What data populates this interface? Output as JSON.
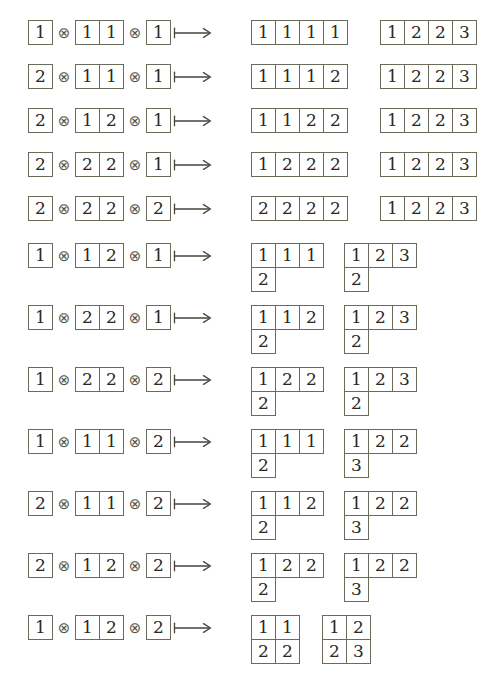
{
  "figure": {
    "type": "tableaux-correspondence-list",
    "operator_tensor": "⊗",
    "operator_maps_to": "⟼",
    "border_color": "#6b6b5c",
    "text_color": "#28281f",
    "background": "#ffffff",
    "cell_size_px": 25
  },
  "rows": [
    {
      "id": "row-1",
      "top": 20,
      "lhs": [
        [
          "1"
        ],
        [
          "1",
          "1"
        ],
        [
          "1"
        ]
      ],
      "rhs": [
        {
          "shape": "1x4",
          "rows": [
            [
              "1",
              "1",
              "1",
              "1"
            ]
          ]
        },
        {
          "shape": "1x4",
          "rows": [
            [
              "1",
              "2",
              "2",
              "3"
            ]
          ]
        }
      ]
    },
    {
      "id": "row-2",
      "top": 64,
      "lhs": [
        [
          "2"
        ],
        [
          "1",
          "1"
        ],
        [
          "1"
        ]
      ],
      "rhs": [
        {
          "shape": "1x4",
          "rows": [
            [
              "1",
              "1",
              "1",
              "2"
            ]
          ]
        },
        {
          "shape": "1x4",
          "rows": [
            [
              "1",
              "2",
              "2",
              "3"
            ]
          ]
        }
      ]
    },
    {
      "id": "row-3",
      "top": 108,
      "lhs": [
        [
          "2"
        ],
        [
          "1",
          "2"
        ],
        [
          "1"
        ]
      ],
      "rhs": [
        {
          "shape": "1x4",
          "rows": [
            [
              "1",
              "1",
              "2",
              "2"
            ]
          ]
        },
        {
          "shape": "1x4",
          "rows": [
            [
              "1",
              "2",
              "2",
              "3"
            ]
          ]
        }
      ]
    },
    {
      "id": "row-4",
      "top": 152,
      "lhs": [
        [
          "2"
        ],
        [
          "2",
          "2"
        ],
        [
          "1"
        ]
      ],
      "rhs": [
        {
          "shape": "1x4",
          "rows": [
            [
              "1",
              "2",
              "2",
              "2"
            ]
          ]
        },
        {
          "shape": "1x4",
          "rows": [
            [
              "1",
              "2",
              "2",
              "3"
            ]
          ]
        }
      ]
    },
    {
      "id": "row-5",
      "top": 196,
      "lhs": [
        [
          "2"
        ],
        [
          "2",
          "2"
        ],
        [
          "2"
        ]
      ],
      "rhs": [
        {
          "shape": "1x4",
          "rows": [
            [
              "2",
              "2",
              "2",
              "2"
            ]
          ]
        },
        {
          "shape": "1x4",
          "rows": [
            [
              "1",
              "2",
              "2",
              "3"
            ]
          ]
        }
      ]
    },
    {
      "id": "row-6",
      "top": 243,
      "lhs": [
        [
          "1"
        ],
        [
          "1",
          "2"
        ],
        [
          "1"
        ]
      ],
      "rhs": [
        {
          "shape": "3+1",
          "rows": [
            [
              "1",
              "1",
              "1"
            ],
            [
              "2"
            ]
          ]
        },
        {
          "shape": "3+1",
          "rows": [
            [
              "1",
              "2",
              "3"
            ],
            [
              "2"
            ]
          ]
        }
      ]
    },
    {
      "id": "row-7",
      "top": 305,
      "lhs": [
        [
          "1"
        ],
        [
          "2",
          "2"
        ],
        [
          "1"
        ]
      ],
      "rhs": [
        {
          "shape": "3+1",
          "rows": [
            [
              "1",
              "1",
              "2"
            ],
            [
              "2"
            ]
          ]
        },
        {
          "shape": "3+1",
          "rows": [
            [
              "1",
              "2",
              "3"
            ],
            [
              "2"
            ]
          ]
        }
      ]
    },
    {
      "id": "row-8",
      "top": 367,
      "lhs": [
        [
          "1"
        ],
        [
          "2",
          "2"
        ],
        [
          "2"
        ]
      ],
      "rhs": [
        {
          "shape": "3+1",
          "rows": [
            [
              "1",
              "2",
              "2"
            ],
            [
              "2"
            ]
          ]
        },
        {
          "shape": "3+1",
          "rows": [
            [
              "1",
              "2",
              "3"
            ],
            [
              "2"
            ]
          ]
        }
      ]
    },
    {
      "id": "row-9",
      "top": 429,
      "lhs": [
        [
          "1"
        ],
        [
          "1",
          "1"
        ],
        [
          "2"
        ]
      ],
      "rhs": [
        {
          "shape": "3+1",
          "rows": [
            [
              "1",
              "1",
              "1"
            ],
            [
              "2"
            ]
          ]
        },
        {
          "shape": "3+1",
          "rows": [
            [
              "1",
              "2",
              "2"
            ],
            [
              "3"
            ]
          ]
        }
      ]
    },
    {
      "id": "row-10",
      "top": 491,
      "lhs": [
        [
          "2"
        ],
        [
          "1",
          "1"
        ],
        [
          "2"
        ]
      ],
      "rhs": [
        {
          "shape": "3+1",
          "rows": [
            [
              "1",
              "1",
              "2"
            ],
            [
              "2"
            ]
          ]
        },
        {
          "shape": "3+1",
          "rows": [
            [
              "1",
              "2",
              "2"
            ],
            [
              "3"
            ]
          ]
        }
      ]
    },
    {
      "id": "row-11",
      "top": 553,
      "lhs": [
        [
          "2"
        ],
        [
          "1",
          "2"
        ],
        [
          "2"
        ]
      ],
      "rhs": [
        {
          "shape": "3+1",
          "rows": [
            [
              "1",
              "2",
              "2"
            ],
            [
              "2"
            ]
          ]
        },
        {
          "shape": "3+1",
          "rows": [
            [
              "1",
              "2",
              "2"
            ],
            [
              "3"
            ]
          ]
        }
      ]
    },
    {
      "id": "row-12",
      "top": 615,
      "lhs": [
        [
          "1"
        ],
        [
          "1",
          "2"
        ],
        [
          "2"
        ]
      ],
      "rhs": [
        {
          "shape": "2x2",
          "rows": [
            [
              "1",
              "1"
            ],
            [
              "2",
              "2"
            ]
          ]
        },
        {
          "shape": "2x2",
          "rows": [
            [
              "1",
              "2"
            ],
            [
              "2",
              "3"
            ]
          ]
        }
      ]
    }
  ]
}
